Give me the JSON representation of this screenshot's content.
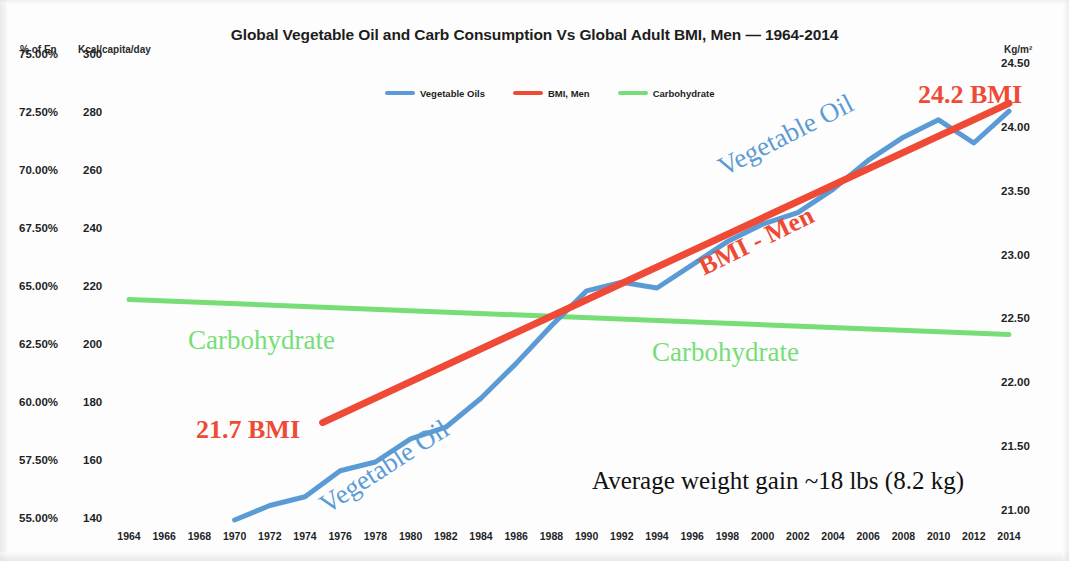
{
  "chart_data": {
    "type": "line",
    "title": "Global Vegetable Oil and Carb Consumption Vs Global Adult BMI, Men — 1964-2014",
    "xlabel": "",
    "grid": false,
    "legend_position": "top-center",
    "x": [
      1964,
      1966,
      1968,
      1970,
      1972,
      1974,
      1976,
      1978,
      1980,
      1982,
      1984,
      1986,
      1988,
      1990,
      1992,
      1994,
      1996,
      1998,
      2000,
      2002,
      2004,
      2006,
      2008,
      2010,
      2012,
      2014
    ],
    "axes": {
      "left_primary": {
        "label": "% of En",
        "ticks": [
          "75.00%",
          "72.50%",
          "70.00%",
          "67.50%",
          "65.00%",
          "62.50%",
          "60.00%",
          "57.50%",
          "55.00%"
        ],
        "values": [
          75.0,
          72.5,
          70.0,
          67.5,
          65.0,
          62.5,
          60.0,
          57.5,
          55.0
        ],
        "lim": [
          55.0,
          75.0
        ]
      },
      "left_secondary": {
        "label": "Kcal/capita/day",
        "ticks": [
          "300",
          "280",
          "260",
          "240",
          "220",
          "200",
          "180",
          "160",
          "140"
        ],
        "values": [
          300,
          280,
          260,
          240,
          220,
          200,
          180,
          160,
          140
        ],
        "lim": [
          140,
          300
        ]
      },
      "right": {
        "label": "Kg/m²",
        "ticks": [
          "24.50",
          "24.00",
          "23.50",
          "23.00",
          "22.50",
          "22.00",
          "21.50",
          "21.00"
        ],
        "values": [
          24.5,
          24.0,
          23.5,
          23.0,
          22.5,
          22.0,
          21.5,
          21.0
        ],
        "lim": [
          21.0,
          24.5
        ]
      }
    },
    "series": [
      {
        "name": "Vegetable Oils",
        "color": "#5b9bd5",
        "unit": "Kcal/capita/day",
        "x": [
          1970,
          1972,
          1974,
          1976,
          1978,
          1980,
          1982,
          1984,
          1986,
          1988,
          1990,
          1992,
          1994,
          1996,
          1998,
          2000,
          2002,
          2004,
          2006,
          2008,
          2010,
          2012,
          2014
        ],
        "values": [
          140,
          145,
          148,
          157,
          160,
          168,
          172,
          182,
          194,
          207,
          219,
          222,
          220,
          228,
          236,
          242,
          246,
          254,
          264,
          272,
          278,
          270,
          281
        ]
      },
      {
        "name": "BMI, Men",
        "color": "#ef4a35",
        "unit": "Kg/m²",
        "x": [
          1975,
          2014
        ],
        "values": [
          21.7,
          24.2
        ],
        "endpoint_labels": [
          "21.7 BMI",
          "24.2 BMI"
        ]
      },
      {
        "name": "Carbohydrate",
        "color": "#77dd77",
        "unit": "% of En",
        "x": [
          1964,
          2014
        ],
        "values": [
          64.5,
          63.0
        ]
      }
    ],
    "legend": [
      {
        "label": "Vegetable Oils",
        "color": "#5b9bd5"
      },
      {
        "label": "BMI, Men",
        "color": "#ef4a35"
      },
      {
        "label": "Carbohydrate",
        "color": "#77dd77"
      }
    ],
    "annotations": [
      {
        "text": "24.2 BMI",
        "color": "#ef4a35",
        "style": "bmi"
      },
      {
        "text": "21.7 BMI",
        "color": "#ef4a35",
        "style": "bmi"
      },
      {
        "text": "Vegetable Oil",
        "color": "#5b9bd5",
        "style": "veg"
      },
      {
        "text": "Vegetable Oil",
        "color": "#5b9bd5",
        "style": "veg"
      },
      {
        "text": "BMI - Men",
        "color": "#ef4a35",
        "style": "bmi"
      },
      {
        "text": "Carbohydrate",
        "color": "#77dd77",
        "style": "carb"
      },
      {
        "text": "Carbohydrate",
        "color": "#77dd77",
        "style": "carb"
      },
      {
        "text": "Average weight gain ~18 lbs (8.2 kg)",
        "color": "#111111",
        "style": "weight"
      }
    ]
  }
}
